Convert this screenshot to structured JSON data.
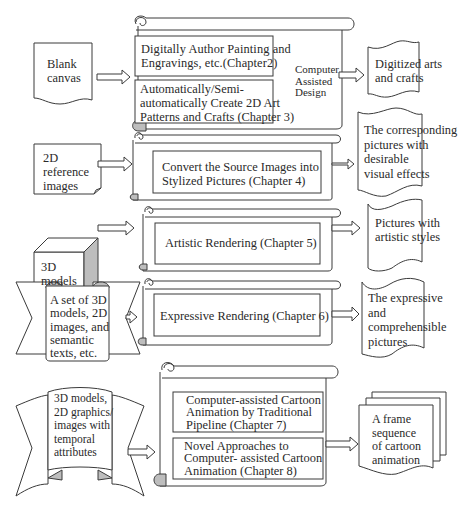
{
  "colors": {
    "stroke": "#3a3a3a",
    "fill": "#ffffff",
    "shade": "#bdbdbd",
    "text": "#2a2a2a"
  },
  "rows": [
    {
      "input": {
        "shape": "document",
        "lines": [
          "Blank",
          "canvas"
        ]
      },
      "process": {
        "shape": "scroll",
        "boxes": [
          {
            "lines": [
              "Digitally Author Painting and",
              "Engravings, etc.(Chapter2)"
            ]
          },
          {
            "lines": [
              "Automatically/Semi-",
              "automatically Create 2D Art",
              "Patterns and Crafts (Chapter 3)"
            ]
          }
        ],
        "side_label": [
          "Computer",
          "Assisted",
          "Design"
        ]
      },
      "output": {
        "shape": "tape",
        "lines": [
          "Digitized arts",
          "and crafts"
        ]
      }
    },
    {
      "input": {
        "shape": "card-folded-corner",
        "lines": [
          "2D",
          "reference",
          "images"
        ]
      },
      "process": {
        "shape": "scroll",
        "boxes": [
          {
            "lines": [
              "Convert the Source Images into",
              "Stylized Pictures (Chapter 4)"
            ]
          }
        ]
      },
      "output": {
        "shape": "tape",
        "lines": [
          "The corresponding",
          "pictures with",
          "desirable",
          "visual effects"
        ]
      }
    },
    {
      "input": {
        "shape": "cube",
        "lines": [
          "3D",
          "models"
        ]
      },
      "process": {
        "shape": "scroll",
        "boxes": [
          {
            "lines": [
              "Artistic Rendering (Chapter 5)"
            ]
          }
        ]
      },
      "output": {
        "shape": "tape",
        "lines": [
          "Pictures with",
          "artistic styles"
        ]
      }
    },
    {
      "input": {
        "shape": "banner",
        "lines": [
          "A set of 3D",
          "models, 2D",
          "images, and",
          "semantic",
          "texts, etc."
        ]
      },
      "process": {
        "shape": "scroll",
        "boxes": [
          {
            "lines": [
              "Expressive Rendering (Chapter 6)"
            ]
          }
        ]
      },
      "output": {
        "shape": "tape",
        "lines": [
          "The expressive",
          "and",
          "comprehensible",
          "pictures"
        ]
      }
    },
    {
      "input": {
        "shape": "banner-curved",
        "lines": [
          "3D models,",
          "2D graphics/",
          "images with",
          "temporal",
          "attributes"
        ]
      },
      "process": {
        "shape": "scroll",
        "boxes": [
          {
            "lines": [
              "Computer-assisted Cartoon",
              "Animation by Traditional",
              "Pipeline (Chapter 7)"
            ]
          },
          {
            "lines": [
              "Novel Approaches to",
              "Computer- assisted Cartoon",
              "Animation (Chapter 8)"
            ]
          }
        ]
      },
      "output": {
        "shape": "multi-document",
        "lines": [
          "A frame",
          "sequence",
          "of cartoon",
          "animation"
        ]
      }
    }
  ],
  "t": {
    "r0_in": "Blank\ncanvas",
    "r0_b0": "Digitally Author Painting and\nEngravings, etc.(Chapter2)",
    "r0_b1": "Automatically/Semi-\nautomatically Create 2D Art\nPatterns and Crafts (Chapter 3)",
    "r0_side": "Computer\nAssisted\nDesign",
    "r0_out": "Digitized arts\nand crafts",
    "r1_in": "2D\nreference\nimages",
    "r1_b0": "Convert the Source Images into\nStylized Pictures (Chapter 4)",
    "r1_out": "The corresponding\npictures with\ndesirable\nvisual effects",
    "r2_in": "3D\nmodels",
    "r2_b0": "Artistic Rendering (Chapter 5)",
    "r2_out": "Pictures with\nartistic styles",
    "r3_in": "A set of 3D\nmodels, 2D\nimages, and\nsemantic\ntexts, etc.",
    "r3_b0": "Expressive Rendering (Chapter 6)",
    "r3_out": "The expressive\nand\ncomprehensible\npictures",
    "r4_in": "3D models,\n2D graphics/\nimages with\ntemporal\nattributes",
    "r4_b0": "Computer-assisted Cartoon\nAnimation by Traditional\nPipeline (Chapter 7)",
    "r4_b1": "Novel Approaches to\nComputer- assisted Cartoon\nAnimation (Chapter 8)",
    "r4_out": "A frame\nsequence\nof cartoon\nanimation"
  }
}
